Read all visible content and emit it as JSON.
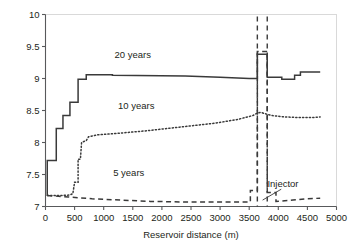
{
  "chart_data": {
    "type": "line",
    "title": "",
    "xlabel": "Reservoir distance (m)",
    "ylabel": "Temperature (C)",
    "xlim": [
      0,
      5000
    ],
    "ylim": [
      7,
      10
    ],
    "xticks": [
      0,
      500,
      1000,
      1500,
      2000,
      2500,
      3000,
      3500,
      4000,
      4500,
      5000
    ],
    "xtick_labels": [
      "0",
      "500",
      "1000",
      "1500",
      "2000",
      "2500",
      "3000",
      "3500",
      "4000",
      "4500",
      "5000"
    ],
    "yticks": [
      7,
      7.5,
      8,
      8.5,
      9,
      9.5,
      10
    ],
    "ytick_labels": [
      "7",
      "7.5",
      "8",
      "8.5",
      "9",
      "9.5",
      "10"
    ],
    "grid": false,
    "legend_position": "inline-annotations",
    "annotations": [
      {
        "text": "20 years",
        "x": 1500,
        "y": 9.32
      },
      {
        "text": "10 years",
        "x": 1560,
        "y": 8.52
      },
      {
        "text": "5 years",
        "x": 1430,
        "y": 7.47
      },
      {
        "text": "Injector",
        "x": 4080,
        "y": 7.3
      }
    ],
    "series": [
      {
        "name": "20 years",
        "label": "20 years",
        "style": "solid",
        "color": "#3a3a3a",
        "points": [
          [
            30,
            7.17
          ],
          [
            30,
            7.72
          ],
          [
            185,
            7.72
          ],
          [
            185,
            8.22
          ],
          [
            300,
            8.22
          ],
          [
            300,
            8.42
          ],
          [
            420,
            8.42
          ],
          [
            420,
            8.63
          ],
          [
            560,
            8.63
          ],
          [
            560,
            8.99
          ],
          [
            700,
            8.99
          ],
          [
            700,
            9.06
          ],
          [
            1150,
            9.06
          ],
          [
            1150,
            9.05
          ],
          [
            2400,
            9.04
          ],
          [
            3000,
            9.02
          ],
          [
            3500,
            9.0
          ],
          [
            3640,
            9.0
          ],
          [
            3640,
            9.38
          ],
          [
            3810,
            9.38
          ],
          [
            3810,
            9.02
          ],
          [
            4060,
            9.02
          ],
          [
            4060,
            8.99
          ],
          [
            4280,
            8.99
          ],
          [
            4280,
            9.05
          ],
          [
            4380,
            9.05
          ],
          [
            4380,
            9.1
          ],
          [
            4720,
            9.1
          ]
        ]
      },
      {
        "name": "10 years",
        "label": "10 years",
        "style": "dotted",
        "color": "#3a3a3a",
        "points": [
          [
            30,
            7.17
          ],
          [
            250,
            7.17
          ],
          [
            420,
            7.18
          ],
          [
            470,
            7.2
          ],
          [
            500,
            7.38
          ],
          [
            560,
            7.38
          ],
          [
            560,
            7.74
          ],
          [
            600,
            7.74
          ],
          [
            620,
            8.0
          ],
          [
            700,
            8.03
          ],
          [
            740,
            8.09
          ],
          [
            900,
            8.12
          ],
          [
            1200,
            8.14
          ],
          [
            1700,
            8.18
          ],
          [
            2300,
            8.24
          ],
          [
            2900,
            8.3
          ],
          [
            3300,
            8.36
          ],
          [
            3560,
            8.42
          ],
          [
            3640,
            8.46
          ],
          [
            3700,
            8.47
          ],
          [
            3810,
            8.44
          ],
          [
            3900,
            8.42
          ],
          [
            4100,
            8.4
          ],
          [
            4350,
            8.39
          ],
          [
            4600,
            8.39
          ],
          [
            4720,
            8.4
          ]
        ]
      },
      {
        "name": "5 years",
        "label": "5 years",
        "style": "dashed",
        "color": "#3a3a3a",
        "points": [
          [
            30,
            7.17
          ],
          [
            400,
            7.15
          ],
          [
            800,
            7.12
          ],
          [
            1300,
            7.1
          ],
          [
            1800,
            7.08
          ],
          [
            2400,
            7.07
          ],
          [
            3000,
            7.07
          ],
          [
            3480,
            7.07
          ],
          [
            3520,
            7.07
          ],
          [
            3520,
            7.25
          ],
          [
            3640,
            7.25
          ],
          [
            3640,
            9.42
          ],
          [
            3810,
            9.42
          ],
          [
            3810,
            7.22
          ],
          [
            3960,
            7.22
          ],
          [
            3960,
            7.08
          ],
          [
            4250,
            7.1
          ],
          [
            4500,
            7.12
          ],
          [
            4720,
            7.13
          ]
        ]
      }
    ],
    "injector_markers": {
      "style": "dashed-vertical",
      "x_positions": [
        3640,
        3810
      ],
      "description": "two dashed vertical lines marking injector well location"
    },
    "leader_line": {
      "from": [
        4050,
        7.27
      ],
      "to": [
        3730,
        7.1
      ]
    }
  }
}
